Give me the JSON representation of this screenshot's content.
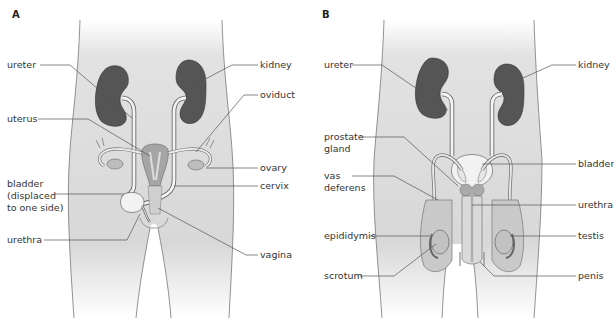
{
  "figure": {
    "panels": [
      {
        "id": "A",
        "letter": "A",
        "labels": {
          "ureter": "ureter",
          "uterus": "uterus",
          "bladder_line1": "bladder",
          "bladder_line2": "(displaced",
          "bladder_line3": "to one side)",
          "urethra": "urethra",
          "kidney": "kidney",
          "oviduct": "oviduct",
          "ovary": "ovary",
          "cervix": "cervix",
          "vagina": "vagina"
        }
      },
      {
        "id": "B",
        "letter": "B",
        "labels": {
          "ureter": "ureter",
          "prostate_line1": "prostate",
          "prostate_line2": "gland",
          "vas_line1": "vas",
          "vas_line2": "deferens",
          "epididymis": "epididymis",
          "scrotum": "scrotum",
          "kidney": "kidney",
          "bladder": "bladder",
          "urethra": "urethra",
          "testis": "testis",
          "penis": "penis"
        }
      }
    ],
    "colors": {
      "body_fill": "#dcdcdc",
      "kidney": "#555555",
      "organ_light": "#f2f2f2",
      "organ_mid": "#a9a9a9",
      "outline": "#666666",
      "leader": "#555555"
    }
  }
}
